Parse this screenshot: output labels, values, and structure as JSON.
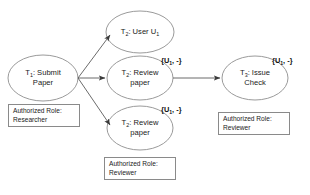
{
  "diagram": {
    "background_color": "#ffffff",
    "stroke_color": "#8a8a8a",
    "arrow_color": "#3a3a3a",
    "text_color": "#1a1a1a"
  },
  "nodes": [
    {
      "id": "t1",
      "name": "submit-paper",
      "line1_prefix": "T",
      "line1_sub": "1",
      "line1_suffix": ": Submit",
      "line2": "Paper"
    },
    {
      "id": "t2user",
      "name": "user-u1",
      "line1_prefix": "T",
      "line1_sub": "2",
      "line1_suffix": ": User U",
      "line1_sub2": "1",
      "line2": ""
    },
    {
      "id": "t2review_top",
      "name": "review-paper-top",
      "line1_prefix": "T",
      "line1_sub": "2",
      "line1_suffix": ": Review",
      "line2": "paper"
    },
    {
      "id": "t2review_bottom",
      "name": "review-paper-bottom",
      "line1_prefix": "T",
      "line1_sub": "2",
      "line1_suffix": ": Review",
      "line2": "paper"
    },
    {
      "id": "t3",
      "name": "issue-check",
      "line1_prefix": "T",
      "line1_sub": "3",
      "line1_suffix": ": Issue",
      "line2": "Check"
    }
  ],
  "edge_labels": [
    {
      "id": "lbl_top",
      "open": "{U",
      "sub": "1",
      "close": ", -}"
    },
    {
      "id": "lbl_bottom",
      "open": "{U",
      "sub": "1",
      "close": ", -}"
    },
    {
      "id": "lbl_right",
      "open": "{U",
      "sub": "1",
      "close": ", -}"
    }
  ],
  "role_boxes": [
    {
      "id": "role_researcher",
      "name": "authorized-role-researcher",
      "line1": "Authorized Role:",
      "line2": "Researcher"
    },
    {
      "id": "role_reviewer_bottom",
      "name": "authorized-role-reviewer-bottom",
      "line1": "Authorized Role:",
      "line2": "Reviewer"
    },
    {
      "id": "role_reviewer_right",
      "name": "authorized-role-reviewer-right",
      "line1": "Authorized Role:",
      "line2": "Reviewer"
    }
  ]
}
